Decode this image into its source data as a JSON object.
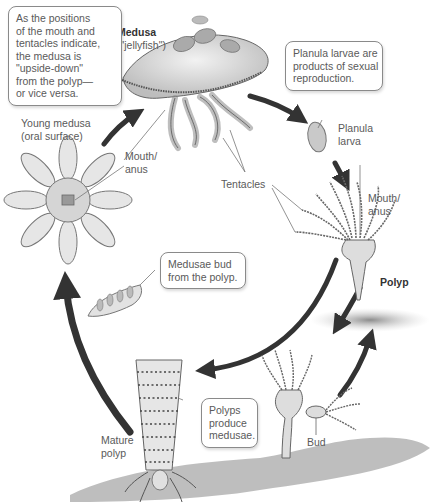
{
  "diagram": {
    "title_label": "Medusa",
    "title_sublabel": "(\"jellyfish\")",
    "stages": [
      {
        "id": "medusa",
        "label": "Medusa",
        "sublabel": "(\"jellyfish\")"
      },
      {
        "id": "planula",
        "label": "Planula\nlarva"
      },
      {
        "id": "polyp",
        "label": "Polyp"
      },
      {
        "id": "bud",
        "label": "Bud"
      },
      {
        "id": "mature-polyp",
        "label": "Mature\npolyp"
      },
      {
        "id": "young-medusa",
        "label": "Young medusa\n(oral surface)"
      }
    ],
    "part_labels": {
      "medusa_mouth": "Mouth/\nanus",
      "polyp_mouth": "Mouth/\nanus",
      "tentacles": "Tentacles"
    },
    "callouts": {
      "upside_down": "As the positions\nof the mouth and\ntentacles indicate,\nthe medusa is\n\"upside-down\"\nfrom the polyp—\nor vice versa.",
      "planula": "Planula larvae are\nproducts of sexual\nreproduction.",
      "medusae_bud": "Medusae bud\nfrom the polyp.",
      "polyps_produce": "Polyps\nproduce\nmedusae."
    },
    "colors": {
      "arrow": "#333333",
      "callout_border": "#8a8a8a",
      "label_text": "#5a5a5a",
      "ground": "#9a9a9a"
    }
  }
}
